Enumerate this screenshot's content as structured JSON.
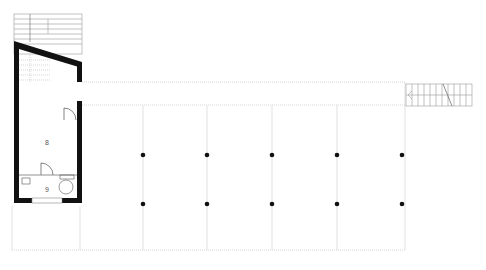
{
  "plan": {
    "type": "architectural-floor-plan",
    "rooms": [
      {
        "id": "room-8",
        "label": "8",
        "x": 47,
        "y": 142
      },
      {
        "id": "room-9",
        "label": "9",
        "x": 47,
        "y": 190
      }
    ],
    "column_x": [
      143,
      207,
      272,
      337,
      402
    ],
    "column_rows_y": [
      155,
      204
    ],
    "colors": {
      "wall": "#111111",
      "line": "#aaaaaa",
      "dotted": "#b5b5b5",
      "stair": "#999999",
      "column": "#111111"
    }
  }
}
